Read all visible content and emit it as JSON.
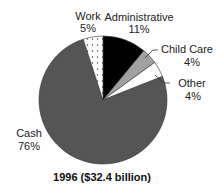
{
  "chart_data": {
    "type": "pie",
    "title": "1996 ($32.4 billion)",
    "start": "12 o'clock",
    "direction": "clockwise",
    "slices": [
      {
        "name": "Administrative",
        "value": 11,
        "label": "Administrative",
        "pct_label": "11%",
        "fill": "#000000",
        "pattern": "solid"
      },
      {
        "name": "Child Care",
        "value": 4,
        "label": "Child Care",
        "pct_label": "4%",
        "fill": "#a0a0a0",
        "pattern": "solid"
      },
      {
        "name": "Other",
        "value": 4,
        "label": "Other",
        "pct_label": "4%",
        "fill": "#ffffff",
        "pattern": "solid"
      },
      {
        "name": "Cash",
        "value": 76,
        "label": "Cash",
        "pct_label": "76%",
        "fill": "#555555",
        "pattern": "solid"
      },
      {
        "name": "Work",
        "value": 5,
        "label": "Work",
        "pct_label": "5%",
        "fill": "#ffffff",
        "pattern": "dotted"
      }
    ]
  }
}
